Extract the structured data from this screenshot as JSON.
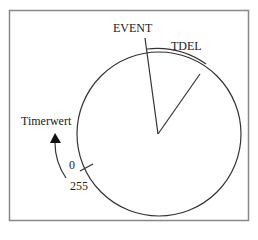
{
  "diagram": {
    "labels": {
      "event": "EVENT",
      "tdel": "TDEL",
      "timer_value": "Timerwert",
      "zero": "0",
      "max": "255"
    },
    "colors": {
      "stroke": "#333333",
      "frame": "#888888",
      "background": "#ffffff"
    }
  }
}
